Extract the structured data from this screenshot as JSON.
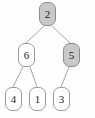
{
  "diagram": {
    "type": "binary-tree",
    "background_color": "#fefefe",
    "node_border_color": "#9a9a9a",
    "node_fill_default": "#ffffff",
    "node_fill_highlight": "#c9c9c9",
    "edge_color": "#9a9a9a",
    "nodes": [
      {
        "id": "root",
        "label": "2",
        "highlighted": true,
        "x": 39,
        "y": 2,
        "level": 0
      },
      {
        "id": "n6",
        "label": "6",
        "highlighted": false,
        "x": 18,
        "y": 43,
        "level": 1
      },
      {
        "id": "n5",
        "label": "5",
        "highlighted": true,
        "x": 63,
        "y": 43,
        "level": 1
      },
      {
        "id": "n4",
        "label": "4",
        "highlighted": false,
        "x": 5,
        "y": 87,
        "level": 2
      },
      {
        "id": "n1",
        "label": "1",
        "highlighted": false,
        "x": 29,
        "y": 87,
        "level": 2
      },
      {
        "id": "n3",
        "label": "3",
        "highlighted": false,
        "x": 53,
        "y": 87,
        "level": 2
      }
    ],
    "edges": [
      {
        "from": "root",
        "to": "n6",
        "x1": 44,
        "y1": 26,
        "x2": 26,
        "y2": 43
      },
      {
        "from": "root",
        "to": "n5",
        "x1": 52,
        "y1": 26,
        "x2": 70,
        "y2": 43
      },
      {
        "from": "n6",
        "to": "n4",
        "x1": 23,
        "y1": 67,
        "x2": 13,
        "y2": 87
      },
      {
        "from": "n6",
        "to": "n1",
        "x1": 30,
        "y1": 67,
        "x2": 37,
        "y2": 87
      },
      {
        "from": "n5",
        "to": "n3",
        "x1": 69,
        "y1": 67,
        "x2": 61,
        "y2": 87
      }
    ]
  }
}
